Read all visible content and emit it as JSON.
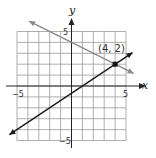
{
  "chart_data": {
    "type": "line",
    "title": "",
    "xlabel": "x",
    "ylabel": "y",
    "xlim": [
      -5,
      5
    ],
    "ylim": [
      -5,
      5
    ],
    "grid": true,
    "grid_step": 1,
    "x_tick_labels": [
      "−5",
      "5"
    ],
    "y_tick_labels": [
      "5",
      "−5"
    ],
    "series": [
      {
        "name": "line-gray",
        "equation": "y = -1/2 x + 4",
        "slope": -0.5,
        "intercept": 4,
        "color": "#8a8a8a",
        "x_range": [
          -3.9,
          5.7
        ],
        "arrows": "both"
      },
      {
        "name": "line-dark",
        "equation": "y = 2/3 x - 2/3",
        "slope": 0.6667,
        "intercept": -0.6667,
        "color": "#1a1a1a",
        "x_range": [
          -5.7,
          5.6
        ],
        "arrows": "both"
      }
    ],
    "annotations": [
      {
        "text": "(4, 2)",
        "point": [
          4,
          2
        ],
        "marker": "filled-square"
      }
    ],
    "legend": null
  },
  "labels": {
    "x_axis": "x",
    "y_axis": "y",
    "x_min": "−5",
    "x_max": "5",
    "y_max": "5",
    "y_min": "−5",
    "intersection": "(4, 2)"
  },
  "colors": {
    "grid": "#9a9a9a",
    "axis": "#222222",
    "gray_line": "#8a8a8a",
    "dark_line": "#1a1a1a"
  }
}
